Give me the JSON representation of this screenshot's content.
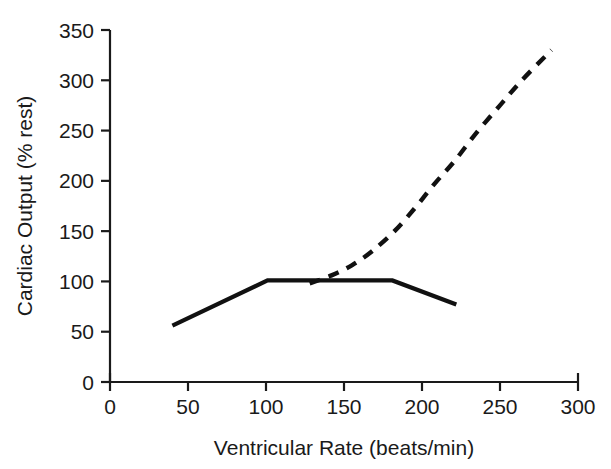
{
  "chart_data": {
    "type": "line",
    "title": "",
    "xlabel": "Ventricular Rate (beats/min)",
    "ylabel": "Cardiac Output (% rest)",
    "xlim": [
      0,
      300
    ],
    "ylim": [
      0,
      350
    ],
    "xticks": [
      0,
      50,
      100,
      150,
      200,
      250,
      300
    ],
    "yticks": [
      0,
      50,
      100,
      150,
      200,
      250,
      300,
      350
    ],
    "xtick_labels": [
      "0",
      "50",
      "100",
      "150",
      "200",
      "250",
      "300"
    ],
    "ytick_labels": [
      "0",
      "50",
      "100",
      "150",
      "200",
      "250",
      "300",
      "350"
    ],
    "grid": false,
    "legend": false,
    "legend_position": "none",
    "series": [
      {
        "name": "solid-curve",
        "style": "solid",
        "color": "#111111",
        "x": [
          40,
          101,
          181,
          222
        ],
        "y": [
          56,
          101,
          101,
          77
        ]
      },
      {
        "name": "dashed-curve",
        "style": "dashed",
        "color": "#111111",
        "x": [
          128,
          142,
          155,
          168,
          183,
          196,
          208,
          221,
          235,
          250,
          264,
          283
        ],
        "y": [
          98,
          106,
          116,
          130,
          151,
          174,
          197,
          220,
          248,
          275,
          300,
          330
        ]
      }
    ]
  },
  "axis": {
    "x_title": "Ventricular Rate (beats/min)",
    "y_title": "Cardiac Output (% rest)"
  }
}
